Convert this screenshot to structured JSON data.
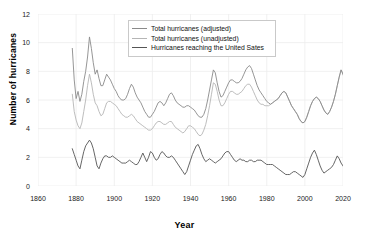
{
  "chart_data": {
    "type": "line",
    "title": "",
    "xlabel": "Year",
    "ylabel": "Number of hurricanes",
    "xlim": [
      1860,
      2020
    ],
    "ylim": [
      0,
      12
    ],
    "xticks": [
      1860,
      1880,
      1900,
      1920,
      1940,
      1960,
      1980,
      2000,
      2020
    ],
    "yticks": [
      0,
      2,
      4,
      6,
      8,
      10,
      12
    ],
    "grid": true,
    "legend_position": "top-center",
    "background": "#ffffff",
    "grid_color": "#ececec",
    "x_start": 1878,
    "x_end": 2013,
    "series": [
      {
        "name": "Total hurricanes (adjusted)",
        "color": "#8a8a8a",
        "x_start": 1878,
        "values": [
          9.6,
          7.4,
          6.1,
          6.6,
          5.9,
          6.4,
          7.3,
          8.0,
          9.0,
          10.4,
          9.6,
          8.6,
          7.8,
          8.1,
          7.5,
          7.0,
          7.0,
          7.4,
          7.8,
          7.6,
          7.4,
          7.1,
          6.8,
          6.6,
          6.3,
          6.1,
          6.0,
          6.0,
          6.1,
          6.4,
          6.8,
          7.1,
          6.9,
          6.5,
          6.2,
          6.0,
          5.8,
          5.5,
          5.2,
          5.0,
          4.8,
          4.8,
          5.0,
          5.2,
          5.5,
          5.8,
          5.9,
          5.8,
          5.6,
          5.8,
          6.1,
          6.4,
          6.5,
          6.3,
          6.0,
          5.8,
          5.7,
          5.6,
          5.5,
          5.5,
          5.6,
          5.6,
          5.5,
          5.4,
          5.3,
          5.1,
          4.9,
          4.8,
          4.8,
          5.0,
          5.4,
          6.0,
          6.7,
          7.4,
          8.1,
          7.9,
          7.2,
          6.6,
          6.2,
          6.3,
          6.6,
          6.9,
          7.2,
          7.4,
          7.4,
          7.3,
          7.2,
          7.2,
          7.3,
          7.5,
          7.8,
          8.1,
          8.3,
          8.4,
          8.2,
          7.8,
          7.4,
          7.0,
          6.7,
          6.5,
          6.3,
          6.1,
          5.9,
          5.8,
          5.7,
          5.8,
          5.9,
          6.0,
          6.1,
          6.3,
          6.5,
          6.6,
          6.5,
          6.2,
          5.9,
          5.6,
          5.4,
          5.2,
          5.0,
          4.7,
          4.5,
          4.4,
          4.5,
          4.8,
          5.2,
          5.6,
          5.9,
          6.1,
          6.2,
          6.1,
          5.9,
          5.6,
          5.3,
          5.1,
          5.0,
          5.2,
          5.5,
          5.9,
          6.4,
          7.0,
          7.6,
          8.1,
          7.8,
          7.4,
          7.2,
          7.4,
          7.7,
          8.0,
          8.3,
          8.6,
          8.3,
          7.9,
          7.6,
          7.4,
          7.2,
          7.4,
          7.6,
          7.3,
          6.8,
          6.4,
          7.0,
          7.2,
          5.6
        ]
      },
      {
        "name": "Total hurricanes (unadjusted)",
        "color": "#b5b5b5",
        "x_start": 1878,
        "values": [
          6.4,
          5.2,
          4.6,
          4.2,
          4.0,
          4.4,
          5.2,
          6.0,
          7.0,
          7.8,
          7.2,
          6.4,
          5.8,
          5.6,
          5.2,
          4.9,
          5.0,
          5.4,
          5.8,
          5.9,
          5.9,
          5.8,
          5.7,
          5.6,
          5.4,
          5.2,
          5.0,
          4.9,
          4.8,
          4.8,
          4.9,
          5.0,
          4.9,
          4.7,
          4.5,
          4.4,
          4.3,
          4.2,
          4.1,
          4.0,
          3.9,
          3.9,
          4.0,
          4.2,
          4.4,
          4.5,
          4.5,
          4.4,
          4.3,
          4.3,
          4.4,
          4.5,
          4.5,
          4.3,
          4.1,
          4.0,
          3.9,
          3.8,
          3.7,
          3.8,
          4.0,
          4.2,
          4.2,
          4.1,
          4.0,
          3.8,
          3.6,
          3.5,
          3.6,
          3.9,
          4.3,
          4.9,
          5.6,
          6.4,
          7.2,
          7.1,
          6.6,
          6.0,
          5.6,
          5.6,
          5.8,
          6.1,
          6.4,
          6.6,
          6.6,
          6.5,
          6.4,
          6.4,
          6.5,
          6.6,
          6.8,
          7.0,
          7.1,
          7.1,
          6.9,
          6.6,
          6.3,
          6.0,
          5.8,
          5.7,
          5.7,
          5.6,
          5.6,
          5.6,
          5.7,
          5.8,
          5.9,
          6.0,
          6.1,
          6.3,
          6.5,
          6.6,
          6.5,
          6.2,
          5.9,
          5.6,
          5.4,
          5.2,
          5.0,
          4.7,
          4.5,
          4.4,
          4.5,
          4.8,
          5.2,
          5.6,
          5.9,
          6.1,
          6.2,
          6.1,
          5.9,
          5.6,
          5.3,
          5.1,
          5.0,
          5.2,
          5.5,
          5.9,
          6.4,
          7.0,
          7.6,
          8.1,
          7.8,
          7.4,
          7.2,
          7.4,
          7.7,
          8.0,
          8.3,
          8.6,
          8.3,
          7.9,
          7.6,
          7.4,
          7.2,
          7.4,
          7.6,
          7.3,
          6.8,
          6.4,
          7.0,
          7.2,
          5.6
        ]
      },
      {
        "name": "Hurricanes reaching the United Sates",
        "color": "#555555",
        "x_start": 1878,
        "values": [
          2.6,
          2.2,
          1.8,
          1.4,
          1.2,
          1.8,
          2.4,
          2.8,
          3.0,
          3.2,
          3.0,
          2.6,
          2.0,
          1.4,
          1.2,
          1.6,
          1.9,
          2.1,
          2.1,
          2.0,
          2.0,
          2.1,
          2.0,
          1.9,
          1.8,
          1.7,
          1.6,
          1.6,
          1.6,
          1.7,
          1.8,
          1.7,
          1.6,
          1.5,
          1.5,
          1.7,
          2.0,
          2.3,
          2.0,
          1.7,
          2.0,
          2.4,
          2.3,
          2.0,
          1.8,
          1.9,
          2.2,
          2.4,
          2.3,
          2.1,
          2.0,
          2.0,
          2.1,
          2.0,
          1.8,
          1.6,
          1.4,
          1.2,
          1.0,
          0.8,
          1.0,
          1.4,
          1.8,
          2.2,
          2.5,
          2.8,
          2.9,
          2.6,
          2.2,
          1.9,
          1.7,
          1.8,
          1.9,
          1.8,
          1.7,
          1.6,
          1.7,
          1.8,
          1.9,
          2.1,
          2.3,
          2.4,
          2.4,
          2.2,
          2.0,
          1.8,
          1.7,
          1.8,
          1.9,
          1.8,
          1.8,
          1.7,
          1.7,
          1.8,
          1.8,
          1.7,
          1.7,
          1.8,
          1.8,
          1.8,
          1.7,
          1.6,
          1.5,
          1.5,
          1.5,
          1.5,
          1.4,
          1.3,
          1.2,
          1.1,
          1.0,
          0.9,
          0.8,
          0.8,
          0.8,
          0.9,
          1.0,
          1.0,
          0.9,
          0.8,
          0.7,
          0.6,
          0.8,
          1.2,
          1.6,
          2.0,
          2.3,
          2.5,
          2.2,
          1.8,
          1.4,
          1.1,
          0.9,
          1.0,
          1.1,
          1.2,
          1.3,
          1.5,
          1.8,
          2.1,
          1.9,
          1.6,
          1.4,
          1.2,
          1.1,
          1.3,
          1.8,
          2.4,
          2.8,
          3.0,
          3.0,
          2.7,
          2.1,
          1.4,
          0.9,
          0.8,
          1.0,
          0.9,
          0.6,
          0.7,
          0.7
        ]
      }
    ]
  },
  "axes": {
    "y_title": "Number of hurricanes",
    "x_title": "Year",
    "y_tick_labels": [
      "0",
      "2",
      "4",
      "6",
      "8",
      "10",
      "12"
    ],
    "x_tick_labels": [
      "1860",
      "1880",
      "1900",
      "1920",
      "1940",
      "1960",
      "1980",
      "2000",
      "2020"
    ]
  },
  "legend": {
    "items": [
      {
        "label": "Total hurricanes (adjusted)",
        "color": "#8a8a8a"
      },
      {
        "label": "Total hurricanes (unadjusted)",
        "color": "#b5b5b5"
      },
      {
        "label": "Hurricanes reaching the United Sates",
        "color": "#555555"
      }
    ]
  }
}
